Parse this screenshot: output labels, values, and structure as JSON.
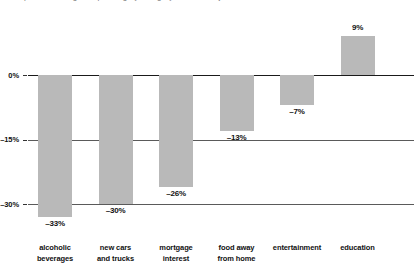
{
  "title_clipped": "percent change in spending by category, inflation adjusted",
  "chart_data": {
    "type": "bar",
    "title": "",
    "xlabel": "",
    "ylabel": "",
    "categories": [
      "alcoholic\nbeverages",
      "new cars\nand trucks",
      "mortgage\ninterest",
      "food away\nfrom home",
      "entertainment",
      "education"
    ],
    "category_lines": [
      [
        "alcoholic",
        "beverages"
      ],
      [
        "new cars",
        "and trucks"
      ],
      [
        "mortgage",
        "interest"
      ],
      [
        "food away",
        "from home"
      ],
      [
        "entertainment",
        ""
      ],
      [
        "education",
        ""
      ]
    ],
    "values": [
      -33,
      -30,
      -26,
      -13,
      -7,
      9
    ],
    "value_labels": [
      "–33%",
      "–30%",
      "–26%",
      "–13%",
      "–7%",
      "9%"
    ],
    "ylim": [
      -36,
      12
    ],
    "yticks": [
      0,
      -15,
      -30
    ],
    "ytick_labels": [
      "0%",
      "–15%",
      "–30%"
    ],
    "grid": true,
    "legend": "none",
    "bar_color": "#b9b9b9",
    "axis_color": "#1a1a1a",
    "text_color": "#111111"
  }
}
